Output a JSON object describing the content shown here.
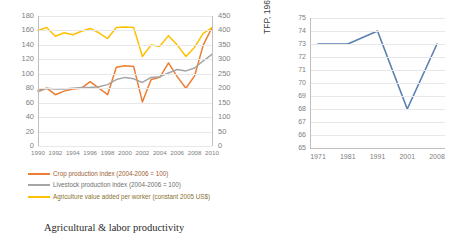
{
  "figure": {
    "left": {
      "caption": "Agricultural & labor productivity",
      "legend": [
        {
          "label": "Crop production index (2004-2006 = 100)",
          "color": "#ED7D31"
        },
        {
          "label": "Livestock production index (2004-2006 = 100)",
          "color": "#A5A5A5"
        },
        {
          "label": "Agriculture value added per worker (constant 2005 US$)",
          "color": "#FFC000"
        }
      ]
    },
    "right": {
      "caption": "Total factor productivity",
      "ylabel": "TFP, 1961=100)"
    }
  },
  "chart_data": [
    {
      "type": "line",
      "title": "",
      "caption": "Agricultural & labor productivity",
      "xlabel": "",
      "ylabel": "",
      "grid": true,
      "legend_position": "bottom",
      "x": [
        1990,
        1991,
        1992,
        1993,
        1994,
        1995,
        1996,
        1997,
        1998,
        1999,
        2000,
        2001,
        2002,
        2003,
        2004,
        2005,
        2006,
        2007,
        2008,
        2009,
        2010
      ],
      "xticklabels": [
        "1990",
        "1992",
        "1994",
        "1996",
        "1998",
        "2000",
        "2002",
        "2004",
        "2006",
        "2008",
        "2010"
      ],
      "ylim": [
        0,
        180
      ],
      "yticks": [
        0,
        20,
        40,
        60,
        80,
        100,
        120,
        140,
        160,
        180
      ],
      "y2lim": [
        0,
        450
      ],
      "y2ticks": [
        0,
        50,
        100,
        150,
        200,
        250,
        300,
        350,
        400,
        450
      ],
      "series": [
        {
          "name": "Crop production index (2004-2006 = 100)",
          "color": "#ED7D31",
          "axis": "left",
          "values": [
            77,
            80,
            71,
            76,
            79,
            80,
            89,
            80,
            71,
            109,
            111,
            110,
            61,
            92,
            95,
            115,
            96,
            80,
            97,
            140,
            164
          ]
        },
        {
          "name": "Livestock production index (2004-2006 = 100)",
          "color": "#A5A5A5",
          "axis": "left",
          "values": [
            75,
            80,
            79,
            79,
            80,
            81,
            81,
            82,
            85,
            92,
            95,
            93,
            88,
            95,
            96,
            101,
            106,
            104,
            108,
            118,
            127
          ]
        },
        {
          "name": "Agriculture value added per worker (constant 2005 US$)",
          "color": "#FFC000",
          "axis": "right",
          "values": [
            400,
            410,
            380,
            392,
            385,
            397,
            407,
            392,
            372,
            410,
            412,
            410,
            310,
            350,
            345,
            382,
            350,
            310,
            342,
            390,
            410
          ]
        }
      ]
    },
    {
      "type": "line",
      "title": "",
      "caption": "Total factor productivity",
      "xlabel": "",
      "ylabel": "TFP, 1961=100)",
      "grid": true,
      "legend_position": "none",
      "categories": [
        "1971",
        "1981",
        "1991",
        "2001",
        "2008"
      ],
      "ylim": [
        65,
        75
      ],
      "yticks": [
        65,
        66,
        67,
        68,
        69,
        70,
        71,
        72,
        73,
        74,
        75
      ],
      "series": [
        {
          "name": "TFP",
          "color": "#5B7FAF",
          "values": [
            73,
            73,
            74,
            68,
            73
          ]
        }
      ]
    }
  ]
}
